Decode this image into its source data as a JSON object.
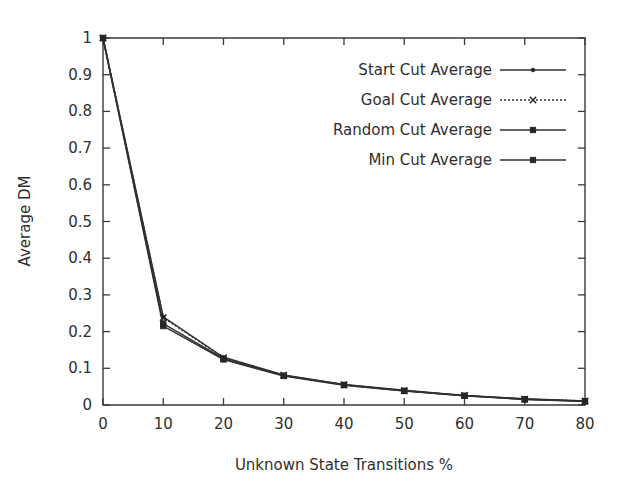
{
  "chart_data": {
    "type": "line",
    "title": "",
    "subtitle": "",
    "xlabel": "Unknown State Transitions %",
    "ylabel": "Average DM",
    "x": [
      0,
      10,
      20,
      30,
      40,
      50,
      60,
      70,
      80
    ],
    "xlim": [
      0,
      80
    ],
    "ylim": [
      0,
      1
    ],
    "xticks": [
      "0",
      "10",
      "20",
      "30",
      "40",
      "50",
      "60",
      "70",
      "80"
    ],
    "yticks": [
      "0",
      "0.1",
      "0.2",
      "0.3",
      "0.4",
      "0.5",
      "0.6",
      "0.7",
      "0.8",
      "0.9",
      "1"
    ],
    "grid": false,
    "legend_position": "top-right-inside",
    "series": [
      {
        "name": "Start Cut Average",
        "style": "solid",
        "marker": "dot",
        "values": [
          1.0,
          0.24,
          0.13,
          0.082,
          0.056,
          0.04,
          0.026,
          0.017,
          0.011
        ]
      },
      {
        "name": "Goal Cut Average",
        "style": "dotted",
        "marker": "cross",
        "values": [
          1.0,
          0.238,
          0.129,
          0.081,
          0.055,
          0.039,
          0.026,
          0.016,
          0.011
        ]
      },
      {
        "name": "Random Cut Average",
        "style": "solid",
        "marker": "square",
        "values": [
          1.0,
          0.222,
          0.126,
          0.08,
          0.055,
          0.039,
          0.025,
          0.016,
          0.01
        ]
      },
      {
        "name": "Min Cut Average",
        "style": "solid",
        "marker": "square",
        "values": [
          1.0,
          0.215,
          0.124,
          0.079,
          0.054,
          0.038,
          0.025,
          0.015,
          0.01
        ]
      }
    ]
  },
  "colors": {
    "background": "#ffffff",
    "axis": "#3a3a3a",
    "text": "#2f2f2f",
    "series": "#303030"
  }
}
